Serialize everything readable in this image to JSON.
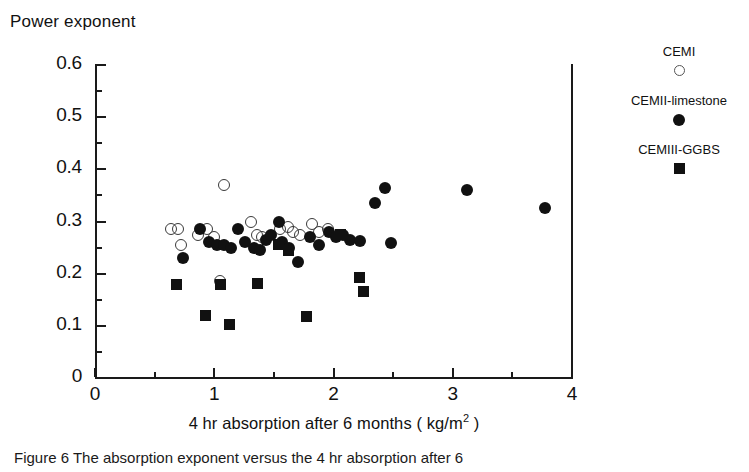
{
  "figure": {
    "y_axis_title": "Power exponent",
    "x_axis_title_main": "4 hr absorption after 6 months ( kg/m",
    "x_axis_title_sup": "2",
    "x_axis_title_tail": " )"
  },
  "legend": {
    "entries": [
      {
        "label": "CEMI",
        "marker": "open-circle"
      },
      {
        "label": "CEMII-limestone",
        "marker": "filled-circle"
      },
      {
        "label": "CEMIII-GGBS",
        "marker": "filled-square"
      }
    ]
  },
  "caption": {
    "text": "Figure 6   The absorption exponent versus the 4 hr absorption after 6"
  },
  "chart_data": {
    "type": "scatter",
    "title": "",
    "xlabel": "4 hr absorption after 6 months ( kg/m2 )",
    "ylabel": "Power exponent",
    "xlim": [
      0,
      4
    ],
    "ylim": [
      0,
      0.6
    ],
    "xticks": [
      0,
      1,
      2,
      3,
      4
    ],
    "yticks": [
      0,
      0.1,
      0.2,
      0.3,
      0.4,
      0.5,
      0.6
    ],
    "xtick_labels": [
      "0",
      "1",
      "2",
      "3",
      "4"
    ],
    "ytick_labels": [
      "0",
      "0.1",
      "0.2",
      "0.3",
      "0.4",
      "0.5",
      "0.6"
    ],
    "minor_tick_step_x": 0.5,
    "minor_tick_step_y": 0.05,
    "grid": false,
    "legend_position": "right",
    "series": [
      {
        "name": "CEMI",
        "marker": "open-circle",
        "points": [
          [
            0.64,
            0.285
          ],
          [
            0.7,
            0.285
          ],
          [
            0.72,
            0.255
          ],
          [
            0.86,
            0.275
          ],
          [
            0.94,
            0.285
          ],
          [
            1.0,
            0.27
          ],
          [
            1.08,
            0.37
          ],
          [
            1.05,
            0.185
          ],
          [
            1.31,
            0.3
          ],
          [
            1.36,
            0.275
          ],
          [
            1.4,
            0.27
          ],
          [
            1.55,
            0.285
          ],
          [
            1.62,
            0.29
          ],
          [
            1.66,
            0.28
          ],
          [
            1.72,
            0.275
          ],
          [
            1.82,
            0.295
          ],
          [
            1.88,
            0.28
          ],
          [
            1.95,
            0.285
          ]
        ]
      },
      {
        "name": "CEMII-limestone",
        "marker": "filled-circle",
        "points": [
          [
            0.74,
            0.23
          ],
          [
            0.88,
            0.285
          ],
          [
            0.96,
            0.26
          ],
          [
            1.02,
            0.255
          ],
          [
            1.08,
            0.255
          ],
          [
            1.14,
            0.25
          ],
          [
            1.2,
            0.285
          ],
          [
            1.26,
            0.26
          ],
          [
            1.33,
            0.25
          ],
          [
            1.38,
            0.245
          ],
          [
            1.43,
            0.265
          ],
          [
            1.48,
            0.275
          ],
          [
            1.54,
            0.3
          ],
          [
            1.57,
            0.26
          ],
          [
            1.63,
            0.25
          ],
          [
            1.7,
            0.222
          ],
          [
            1.8,
            0.27
          ],
          [
            1.88,
            0.255
          ],
          [
            1.96,
            0.28
          ],
          [
            2.02,
            0.27
          ],
          [
            2.08,
            0.275
          ],
          [
            2.14,
            0.265
          ],
          [
            2.22,
            0.262
          ],
          [
            2.35,
            0.335
          ],
          [
            2.43,
            0.365
          ],
          [
            2.48,
            0.258
          ],
          [
            3.12,
            0.36
          ],
          [
            3.77,
            0.325
          ]
        ]
      },
      {
        "name": "CEMIII-GGBS",
        "marker": "filled-square",
        "points": [
          [
            0.68,
            0.18
          ],
          [
            0.93,
            0.12
          ],
          [
            1.13,
            0.102
          ],
          [
            1.05,
            0.18
          ],
          [
            1.36,
            0.182
          ],
          [
            1.54,
            0.255
          ],
          [
            1.62,
            0.245
          ],
          [
            1.77,
            0.118
          ],
          [
            2.06,
            0.275
          ],
          [
            2.22,
            0.192
          ],
          [
            2.25,
            0.166
          ]
        ]
      }
    ]
  }
}
